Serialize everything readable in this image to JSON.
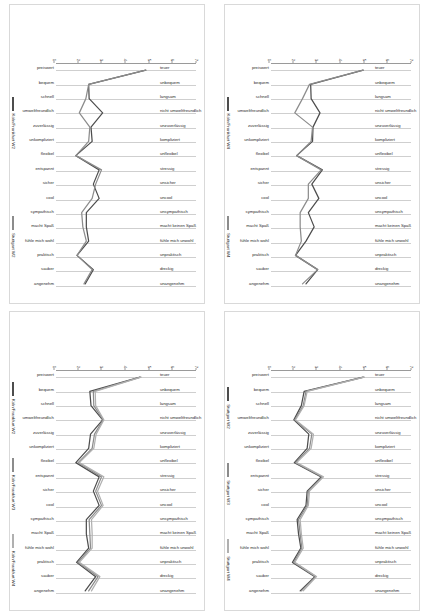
{
  "document": {
    "page_background": "#ffffff",
    "panel_border_color": "#d9d9d9",
    "orientation": "landscape-charts-rotated-90deg",
    "layout": "2x2 grid of semantic differential (polarity profile) line charts"
  },
  "axis": {
    "y_ticks": [
      "1",
      "2",
      "3",
      "4",
      "5",
      "6",
      "7"
    ],
    "ylim": [
      1,
      7
    ],
    "gridlines": true
  },
  "categories_positive": [
    "preiswert",
    "bequem",
    "schnell",
    "umweltfreundlich",
    "zuverlässig",
    "unkompliziert",
    "flexibel",
    "entspannt",
    "sicher",
    "cool",
    "sympathisch",
    "macht Spaß",
    "fühle mich wohl",
    "praktisch",
    "sauber",
    "angenehm"
  ],
  "categories_negative": [
    "teuer",
    "unbequem",
    "langsam",
    "nicht umweltfreundlich",
    "unzuverlässig",
    "kompliziert",
    "unflexibel",
    "stressig",
    "unsicher",
    "uncool",
    "unsympathisch",
    "macht keinen Spaß",
    "fühle mich unwohl",
    "unpraktisch",
    "dreckig",
    "unangenehm"
  ],
  "panels": [
    {
      "id": "panel-top-left",
      "position": "top-left",
      "legend": [
        {
          "label": "Köln/Frankfurt W2",
          "color": "#4d4d4d"
        },
        {
          "label": "Stuttgart W2",
          "color": "#8c8c8c"
        }
      ],
      "chart_data": {
        "type": "line",
        "title": "",
        "xlabel": "",
        "ylabel": "",
        "ylim": [
          1,
          7
        ],
        "grid": true,
        "legend_position": "right",
        "categories": [
          "preiswert",
          "bequem",
          "schnell",
          "umweltfreundlich",
          "zuverlässig",
          "unkompliziert",
          "flexibel",
          "entspannt",
          "sicher",
          "cool",
          "sympathisch",
          "macht Spaß",
          "fühle mich wohl",
          "praktisch",
          "sauber",
          "angenehm"
        ],
        "categories_right": [
          "teuer",
          "unbequem",
          "langsam",
          "nicht umweltfreundlich",
          "unzuverlässig",
          "kompliziert",
          "unflexibel",
          "stressig",
          "unsicher",
          "uncool",
          "unsympathisch",
          "macht keinen Spaß",
          "fühle mich unwohl",
          "unpraktisch",
          "dreckig",
          "unangenehm"
        ],
        "series": [
          {
            "name": "Köln/Frankfurt W2",
            "color": "#4d4d4d",
            "values": [
              4.85,
              2.4,
              2.42,
              3.0,
              2.5,
              2.55,
              1.85,
              2.85,
              2.6,
              2.85,
              2.3,
              2.3,
              2.4,
              1.9,
              2.6,
              2.25
            ]
          },
          {
            "name": "Stuttgart W2",
            "color": "#8c8c8c",
            "values": [
              4.85,
              2.4,
              2.28,
              2.0,
              2.45,
              2.4,
              1.85,
              2.95,
              2.7,
              2.55,
              2.1,
              2.15,
              2.3,
              1.9,
              2.55,
              2.2
            ]
          }
        ]
      }
    },
    {
      "id": "panel-top-right",
      "position": "top-right",
      "legend": [
        {
          "label": "Köln/Frankfurt W4",
          "color": "#4d4d4d"
        },
        {
          "label": "Stuttgart W4",
          "color": "#8c8c8c"
        }
      ],
      "chart_data": {
        "type": "line",
        "title": "",
        "xlabel": "",
        "ylabel": "",
        "ylim": [
          1,
          7
        ],
        "grid": true,
        "legend_position": "right",
        "categories": [
          "preiswert",
          "bequem",
          "schnell",
          "umweltfreundlich",
          "zuverlässig",
          "unkompliziert",
          "flexibel",
          "entspannt",
          "sicher",
          "cool",
          "sympathisch",
          "macht Spaß",
          "fühle mich wohl",
          "praktisch",
          "sauber",
          "angenehm"
        ],
        "categories_right": [
          "teuer",
          "unbequem",
          "langsam",
          "nicht umweltfreundlich",
          "unzuverlässig",
          "kompliziert",
          "unflexibel",
          "stressig",
          "unsicher",
          "uncool",
          "unsympathisch",
          "macht keinen Spaß",
          "fühle mich unwohl",
          "unpraktisch",
          "dreckig",
          "unangenehm"
        ],
        "series": [
          {
            "name": "Köln/Frankfurt W4",
            "color": "#4d4d4d",
            "values": [
              4.95,
              2.7,
              2.72,
              3.1,
              2.8,
              2.78,
              2.1,
              3.2,
              2.75,
              3.05,
              2.6,
              2.85,
              2.5,
              2.05,
              3.0,
              2.5
            ]
          },
          {
            "name": "Stuttgart W4",
            "color": "#8c8c8c",
            "values": [
              4.95,
              2.65,
              2.35,
              2.02,
              2.78,
              2.72,
              2.1,
              3.15,
              2.6,
              2.6,
              2.25,
              2.25,
              2.3,
              2.05,
              3.0,
              2.35
            ]
          }
        ]
      }
    },
    {
      "id": "panel-bottom-left",
      "position": "bottom-left",
      "legend": [
        {
          "label": "Köln/Frankfurt W2",
          "color": "#4d4d4d"
        },
        {
          "label": "Köln/Frankfurt W3",
          "color": "#8c8c8c"
        },
        {
          "label": "Köln/Frankfurt W4",
          "color": "#b0b0b0"
        }
      ],
      "chart_data": {
        "type": "line",
        "title": "",
        "xlabel": "",
        "ylabel": "",
        "ylim": [
          1,
          7
        ],
        "grid": true,
        "legend_position": "right",
        "categories": [
          "preiswert",
          "bequem",
          "schnell",
          "umweltfreundlich",
          "zuverlässig",
          "unkompliziert",
          "flexibel",
          "entspannt",
          "sicher",
          "cool",
          "sympathisch",
          "macht Spaß",
          "fühle mich wohl",
          "praktisch",
          "sauber",
          "angenehm"
        ],
        "categories_right": [
          "teuer",
          "unbequem",
          "langsam",
          "nicht umweltfreundlich",
          "unzuverlässig",
          "kompliziert",
          "unflexibel",
          "stressig",
          "unsicher",
          "uncool",
          "unsympathisch",
          "macht keinen Spaß",
          "fühle mich unwohl",
          "unpraktisch",
          "dreckig",
          "unangenehm"
        ],
        "series": [
          {
            "name": "Köln/Frankfurt W2",
            "color": "#4d4d4d",
            "values": [
              4.6,
              2.45,
              2.5,
              3.0,
              2.48,
              2.4,
              1.85,
              2.85,
              2.6,
              2.85,
              2.3,
              2.3,
              2.4,
              1.88,
              2.7,
              2.25
            ]
          },
          {
            "name": "Köln/Frankfurt W3",
            "color": "#8c8c8c",
            "values": [
              4.62,
              2.6,
              2.62,
              3.02,
              2.65,
              2.55,
              1.95,
              2.95,
              2.7,
              2.95,
              2.42,
              2.45,
              2.48,
              1.95,
              2.8,
              2.4
            ]
          },
          {
            "name": "Köln/Frankfurt W4",
            "color": "#b0b0b0",
            "values": [
              4.65,
              2.68,
              2.7,
              3.05,
              2.72,
              2.62,
              2.0,
              3.05,
              2.78,
              3.02,
              2.52,
              2.55,
              2.55,
              2.0,
              2.88,
              2.52
            ]
          }
        ]
      }
    },
    {
      "id": "panel-bottom-right",
      "position": "bottom-right",
      "legend": [
        {
          "label": "Stuttgart W2",
          "color": "#4d4d4d"
        },
        {
          "label": "Stuttgart W3",
          "color": "#8c8c8c"
        },
        {
          "label": "Stuttgart W4",
          "color": "#b0b0b0"
        }
      ],
      "chart_data": {
        "type": "line",
        "title": "",
        "xlabel": "",
        "ylabel": "",
        "ylim": [
          1,
          7
        ],
        "grid": true,
        "legend_position": "right",
        "categories": [
          "preiswert",
          "bequem",
          "schnell",
          "umweltfreundlich",
          "zuverlässig",
          "unkompliziert",
          "flexibel",
          "entspannt",
          "sicher",
          "cool",
          "sympathisch",
          "macht Spaß",
          "fühle mich wohl",
          "praktisch",
          "sauber",
          "angenehm"
        ],
        "categories_right": [
          "teuer",
          "unbequem",
          "langsam",
          "nicht umweltfreundlich",
          "unzuverlässig",
          "kompliziert",
          "unflexibel",
          "stressig",
          "unsicher",
          "uncool",
          "unsympathisch",
          "macht keinen Spaß",
          "fühle mich unwohl",
          "unpraktisch",
          "dreckig",
          "unangenehm"
        ],
        "series": [
          {
            "name": "Stuttgart W2",
            "color": "#4d4d4d",
            "values": [
              4.95,
              2.42,
              2.3,
              1.98,
              2.62,
              2.55,
              2.0,
              3.15,
              2.55,
              2.5,
              2.12,
              2.18,
              2.28,
              1.92,
              2.88,
              2.25
            ]
          },
          {
            "name": "Stuttgart W3",
            "color": "#8c8c8c",
            "values": [
              4.98,
              2.5,
              2.38,
              2.02,
              2.75,
              2.65,
              2.05,
              3.2,
              2.6,
              2.55,
              2.18,
              2.25,
              2.32,
              1.98,
              2.92,
              2.3
            ]
          },
          {
            "name": "Stuttgart W4",
            "color": "#b0b0b0",
            "values": [
              5.0,
              2.55,
              2.42,
              2.05,
              2.82,
              2.72,
              2.1,
              3.25,
              2.65,
              2.6,
              2.25,
              2.3,
              2.38,
              2.02,
              2.95,
              2.38
            ]
          }
        ]
      }
    }
  ]
}
